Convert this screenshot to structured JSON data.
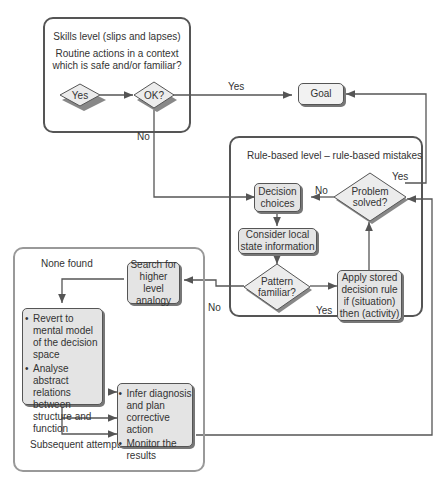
{
  "skills_level": {
    "title": "Skills level (slips and lapses)",
    "question_line1": "Routine actions in a context",
    "question_line2": "which is safe and/or familiar?",
    "yes_node": "Yes",
    "ok_node": "OK?"
  },
  "goal": {
    "label": "Goal"
  },
  "edge_labels": {
    "ok_yes": "Yes",
    "ok_no": "No",
    "problem_no": "No",
    "problem_yes": "Yes",
    "pattern_no": "No",
    "pattern_yes": "Yes",
    "subsequent": "Subsequent attempts"
  },
  "rule_level": {
    "title": "Rule-based level – rule-based mistakes",
    "decision_choices_1": "Decision",
    "decision_choices_2": "choices",
    "problem_solved_1": "Problem",
    "problem_solved_2": "solved?",
    "consider_1": "Consider local",
    "consider_2": "state information",
    "pattern_1": "Pattern",
    "pattern_2": "familiar?",
    "apply_1": "Apply stored",
    "apply_2": "decision rule",
    "apply_3": "if (situation)",
    "apply_4": "then (activity)"
  },
  "knowledge_level": {
    "title": "None found",
    "search_1": "Search for",
    "search_2": "higher level",
    "search_3": "analogy",
    "revert": "Revert to mental model of the decision space",
    "analyse": "Analyse abstract relations between structure and function",
    "infer": "Infer diagnosis and plan corrective action",
    "monitor": "Monitor the results"
  },
  "colors": {
    "line": "#555555",
    "box_fill": "#e4e4e4",
    "outer_frame": "#999999"
  }
}
